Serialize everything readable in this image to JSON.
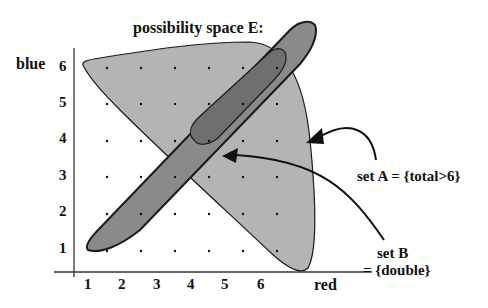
{
  "diagram": {
    "title": "possibility space E:",
    "y_axis_label": "blue",
    "x_axis_label": "red",
    "x_ticks": [
      "1",
      "2",
      "3",
      "4",
      "5",
      "6"
    ],
    "y_ticks": [
      "1",
      "2",
      "3",
      "4",
      "5",
      "6"
    ],
    "annotations": {
      "set_a": "set A =  {total>6}",
      "set_b_line1": "set B",
      "set_b_line2": "= {double}"
    },
    "colors": {
      "set_a_fill": "#b4b4b4",
      "set_b_fill": "#8a8a8a",
      "overlap_fill": "#6f6f6f",
      "outline": "#1a1a1a",
      "background": "#ffffff"
    },
    "grid": {
      "rows": 6,
      "cols": 6,
      "description": "6x6 dot grid of outcomes (red, blue)"
    }
  }
}
